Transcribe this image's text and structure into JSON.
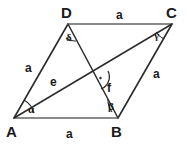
{
  "figure": {
    "kind": "rhombus-with-diagonals",
    "background_color": "#ffffff",
    "stroke_color": "#2b2b2b",
    "edge_color": "#7a7a7a",
    "text_color": "#1a1a1a"
  },
  "vertices": [
    {
      "id": "D",
      "label": "D",
      "x": 68,
      "y": 24
    },
    {
      "id": "C",
      "label": "C",
      "x": 172,
      "y": 24
    },
    {
      "id": "A",
      "label": "A",
      "x": 14,
      "y": 118
    },
    {
      "id": "B",
      "label": "B",
      "x": 118,
      "y": 118
    }
  ],
  "sides": [
    {
      "id": "DC",
      "label": "a",
      "from": "D",
      "to": "C"
    },
    {
      "id": "AD",
      "label": "a",
      "from": "A",
      "to": "D"
    },
    {
      "id": "BC",
      "label": "a",
      "from": "B",
      "to": "C"
    },
    {
      "id": "AB",
      "label": "a",
      "from": "A",
      "to": "B"
    }
  ],
  "diagonals": [
    {
      "id": "AC",
      "label": "e",
      "from": "A",
      "to": "C"
    },
    {
      "id": "DB",
      "label": "f",
      "from": "D",
      "to": "B"
    }
  ],
  "intersection": {
    "x": 97,
    "y": 77,
    "marker": "right-angle-dot"
  },
  "angles": [
    {
      "id": "alpha",
      "label": "α",
      "at_vertex": "A"
    },
    {
      "id": "beta",
      "label": "β",
      "at_vertex": "B"
    },
    {
      "id": "gamma",
      "label": "γ",
      "at_vertex": "C"
    },
    {
      "id": "delta",
      "label": "δ",
      "at_vertex": "D"
    }
  ],
  "labels": {
    "vertex_D": "D",
    "vertex_C": "C",
    "vertex_A": "A",
    "vertex_B": "B",
    "side_top": "a",
    "side_left": "a",
    "side_right": "a",
    "side_bottom": "a",
    "diagonal_e": "e",
    "diagonal_f": "f",
    "angle_alpha": "α",
    "angle_beta": "β",
    "angle_gamma": "γ",
    "angle_delta": "δ"
  }
}
